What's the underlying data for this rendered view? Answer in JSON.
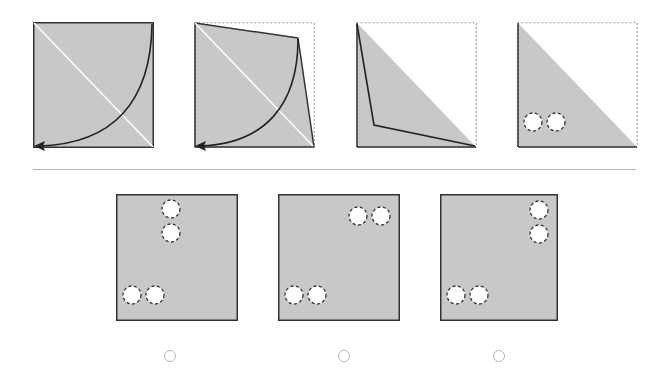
{
  "puzzle": {
    "type": "paper-folding",
    "colors": {
      "paper": "#c8c8c8",
      "stroke": "#333333",
      "fold_line": "#ffffff",
      "hole_fill": "#ffffff",
      "dotted_outline": "#888888",
      "divider": "#b4b4b4",
      "radio_border": "#b8b8b8"
    },
    "steps": [
      {
        "index": 1,
        "description": "Full square with diagonal fold line and curved arrow from top-right to bottom-left"
      },
      {
        "index": 2,
        "description": "Top-right corner partially folded toward bottom-left; dotted original outline; curved arrow"
      },
      {
        "index": 3,
        "description": "Folded into triangle (lower-left half); dotted outline of original square; inner fold edge"
      },
      {
        "index": 4,
        "description": "Triangle with two punched holes near bottom-left"
      }
    ],
    "options": [
      {
        "index": 1,
        "label": "A",
        "holes": [
          [
            0.47,
            0.13
          ],
          [
            0.47,
            0.32
          ],
          [
            0.13,
            0.79
          ],
          [
            0.32,
            0.79
          ]
        ]
      },
      {
        "index": 2,
        "label": "B",
        "holes": [
          [
            0.62,
            0.17
          ],
          [
            0.81,
            0.17
          ],
          [
            0.13,
            0.79
          ],
          [
            0.32,
            0.79
          ]
        ]
      },
      {
        "index": 3,
        "label": "C",
        "holes": [
          [
            0.84,
            0.13
          ],
          [
            0.84,
            0.32
          ],
          [
            0.13,
            0.79
          ],
          [
            0.32,
            0.79
          ]
        ]
      }
    ]
  }
}
